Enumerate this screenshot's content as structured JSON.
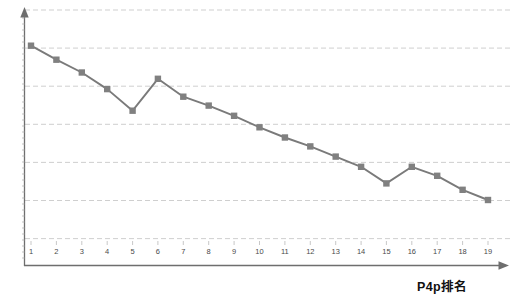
{
  "chart_data": {
    "type": "line",
    "title": "",
    "subtitle": "",
    "xlabel": "P4p排名",
    "ylabel": "",
    "categories": [
      "1",
      "2",
      "3",
      "4",
      "5",
      "6",
      "7",
      "8",
      "9",
      "10",
      "11",
      "12",
      "13",
      "14",
      "15",
      "16",
      "17",
      "18",
      "19"
    ],
    "x": [
      1,
      2,
      3,
      4,
      5,
      6,
      7,
      8,
      9,
      10,
      11,
      12,
      13,
      14,
      15,
      16,
      17,
      18,
      19
    ],
    "series": [
      {
        "name": "P4p",
        "values": [
          86.0,
          80.5,
          75.5,
          69.0,
          60.5,
          73.0,
          66.0,
          62.5,
          58.5,
          54.0,
          50.0,
          46.5,
          42.5,
          38.5,
          32.0,
          38.5,
          35.0,
          29.5,
          25.5
        ],
        "color": "#808080",
        "marker": "square"
      }
    ],
    "ylim": [
      0,
      100
    ],
    "xlim": [
      0.4,
      19.8
    ],
    "gridlines": {
      "horizontal": true,
      "vertical": false,
      "style": "dashed",
      "color": "#c8c8c8",
      "count": 7
    },
    "yticks": [],
    "legend": {
      "visible": false,
      "position": "none"
    },
    "axis_style": {
      "x_axis_arrow": true,
      "y_axis_arrow": true,
      "axis_color": "#6b6b6b",
      "tick_marks": true
    }
  },
  "axes": {
    "x_tick_labels": [
      "1",
      "2",
      "3",
      "4",
      "5",
      "6",
      "7",
      "8",
      "9",
      "10",
      "11",
      "12",
      "13",
      "14",
      "15",
      "16",
      "17",
      "18",
      "19"
    ],
    "x_title": "P4p排名"
  },
  "colors": {
    "series": "#808080",
    "line": "#7a7a7a",
    "grid": "#c9c9c9",
    "axis": "#6e6e6e",
    "tick_text": "#4a4a4a",
    "title_text": "#111111",
    "background": "#ffffff"
  }
}
